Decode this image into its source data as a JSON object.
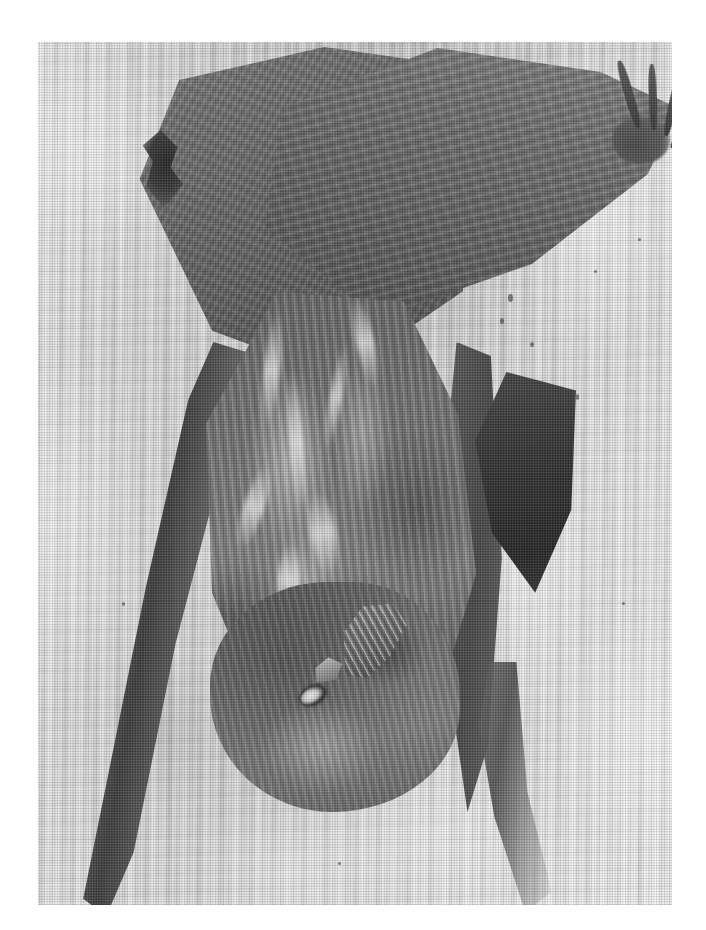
{
  "page": {
    "width": 706,
    "height": 930,
    "background_color": "#ffffff",
    "media": "scanned halftone photographic plate",
    "color_mode": "black-and-white / grayscale"
  },
  "plate": {
    "x": 38,
    "y": 42,
    "width": 634,
    "height": 863,
    "border": "none (photo bleeds to soft edge)",
    "margin_color": "#ffffff"
  },
  "photo": {
    "subject": "bat hanging upside down",
    "subject_alt": "roosting bat clinging head-down to weathered wood",
    "setting": "pale weathered wood / tree bark with vertical grain",
    "orientation": "portrait",
    "lighting": "flat frontal daylight",
    "tones": {
      "paper_white": "#ffffff",
      "bark_light": "#ded9d3",
      "bark_mid": "#c9c6c1",
      "bark_shadow": "#a9a59f",
      "fur_highlight": "#f0ece5",
      "fur_mid": "#8a857c",
      "fur_shadow": "#5a5751",
      "membrane_mid": "#6e6a64",
      "membrane_dark": "#2b2927",
      "deepest_black": "#1a1917"
    },
    "parts": [
      {
        "name": "left-wing-membrane",
        "label": "Left wing membrane",
        "note": "broad dark triangle sweeping up-left, finely wrinkled"
      },
      {
        "name": "right-wing-membrane",
        "label": "Right wing membrane",
        "note": "spread across the top toward the upper-right corner"
      },
      {
        "name": "wing-finger-tips",
        "label": "Wing finger tips",
        "note": "four slender digits splayed at the upper right"
      },
      {
        "name": "thumb-claw",
        "label": "Thumb claw",
        "note": "dark hooked claw gripping bark at the upper left"
      },
      {
        "name": "body-fur",
        "label": "Body fur",
        "note": "pale streaky chevrons of light fur down the back"
      },
      {
        "name": "head",
        "label": "Head",
        "note": "inverted, lower-left of frame"
      },
      {
        "name": "eye",
        "label": "Eye",
        "note": "small glinting dark eye"
      },
      {
        "name": "ear",
        "label": "Ear",
        "note": "large ear with ridged inner striations"
      },
      {
        "name": "tragus",
        "label": "Tragus",
        "note": "pointed flap in front of the ear opening"
      },
      {
        "name": "right-forearm",
        "label": "Right forearm",
        "note": "long pale bar running down the right of the body"
      },
      {
        "name": "left-forearm",
        "label": "Left forearm",
        "note": "long dark bar angling to the lower-left corner"
      },
      {
        "name": "folded-wing-pocket",
        "label": "Folded wing pocket",
        "note": "deep black fold beside the right flank"
      }
    ],
    "print_artifacts": [
      "halftone dot screen",
      "scanner line noise",
      "soft edge vignette"
    ]
  },
  "caption": {
    "text": ""
  }
}
